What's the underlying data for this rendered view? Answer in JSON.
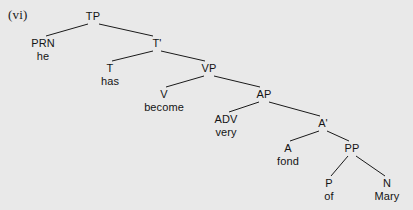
{
  "figure": {
    "example_number": "(vi)",
    "background_color": "#e9e9e9",
    "line_color": "#1a1a1a",
    "text_color": "#141414",
    "width": 413,
    "height": 210
  },
  "tree": {
    "type": "syntax-tree",
    "sentence": "he has become very fond of Mary",
    "nodes": [
      {
        "id": "TP",
        "label": "TP",
        "word": "",
        "x": 93,
        "y": 10
      },
      {
        "id": "PRN",
        "label": "PRN",
        "word": "he",
        "x": 43,
        "y": 37
      },
      {
        "id": "Tbar",
        "label": "T'",
        "word": "",
        "x": 157,
        "y": 37
      },
      {
        "id": "T",
        "label": "T",
        "word": "has",
        "x": 110,
        "y": 62
      },
      {
        "id": "VP",
        "label": "VP",
        "word": "",
        "x": 209,
        "y": 62
      },
      {
        "id": "V",
        "label": "V",
        "word": "become",
        "x": 164,
        "y": 88
      },
      {
        "id": "AP",
        "label": "AP",
        "word": "",
        "x": 264,
        "y": 88
      },
      {
        "id": "ADV",
        "label": "ADV",
        "word": "very",
        "x": 226,
        "y": 113
      },
      {
        "id": "Abar",
        "label": "A'",
        "word": "",
        "x": 323,
        "y": 117
      },
      {
        "id": "A",
        "label": "A",
        "word": "fond",
        "x": 288,
        "y": 142
      },
      {
        "id": "PP",
        "label": "PP",
        "word": "",
        "x": 352,
        "y": 142
      },
      {
        "id": "P",
        "label": "P",
        "word": "of",
        "x": 329,
        "y": 177
      },
      {
        "id": "N",
        "label": "N",
        "word": "Mary",
        "x": 387,
        "y": 177
      }
    ],
    "branches": [
      {
        "from": "TP",
        "to": "PRN",
        "x1": 88,
        "y1": 24,
        "x2": 46,
        "y2": 36
      },
      {
        "from": "TP",
        "to": "Tbar",
        "x1": 99,
        "y1": 24,
        "x2": 153,
        "y2": 36
      },
      {
        "from": "Tbar",
        "to": "T",
        "x1": 153,
        "y1": 51,
        "x2": 112,
        "y2": 61
      },
      {
        "from": "Tbar",
        "to": "VP",
        "x1": 161,
        "y1": 51,
        "x2": 205,
        "y2": 61
      },
      {
        "from": "VP",
        "to": "V",
        "x1": 204,
        "y1": 76,
        "x2": 166,
        "y2": 87
      },
      {
        "from": "VP",
        "to": "AP",
        "x1": 214,
        "y1": 76,
        "x2": 260,
        "y2": 87
      },
      {
        "from": "AP",
        "to": "ADV",
        "x1": 259,
        "y1": 102,
        "x2": 229,
        "y2": 112
      },
      {
        "from": "AP",
        "to": "Abar",
        "x1": 269,
        "y1": 102,
        "x2": 320,
        "y2": 116
      },
      {
        "from": "Abar",
        "to": "A",
        "x1": 319,
        "y1": 131,
        "x2": 290,
        "y2": 141
      },
      {
        "from": "Abar",
        "to": "PP",
        "x1": 327,
        "y1": 131,
        "x2": 349,
        "y2": 141
      },
      {
        "from": "PP",
        "to": "P",
        "x1": 348,
        "y1": 156,
        "x2": 331,
        "y2": 176
      },
      {
        "from": "PP",
        "to": "N",
        "x1": 356,
        "y1": 156,
        "x2": 385,
        "y2": 176
      }
    ]
  }
}
